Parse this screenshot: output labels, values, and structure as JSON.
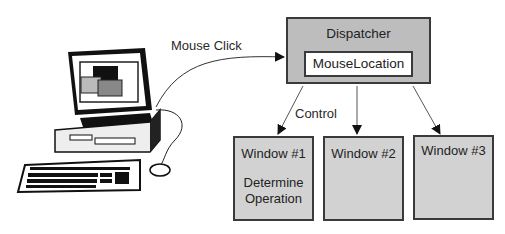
{
  "diagram": {
    "computer": {
      "label": ""
    },
    "edges": {
      "mouse_click": "Mouse Click",
      "control": "Control"
    },
    "dispatcher": {
      "title": "Dispatcher",
      "component": "MouseLocation"
    },
    "windows": [
      {
        "title": "Window #1",
        "body_line1": "Determine",
        "body_line2": "Operation"
      },
      {
        "title": "Window #2"
      },
      {
        "title": "Window #3"
      }
    ],
    "colors": {
      "box_fill": "#d2d2d2",
      "dispatcher_fill": "#bdbdbd",
      "inner_fill": "#ffffff",
      "stroke": "#3a3a3a"
    }
  }
}
